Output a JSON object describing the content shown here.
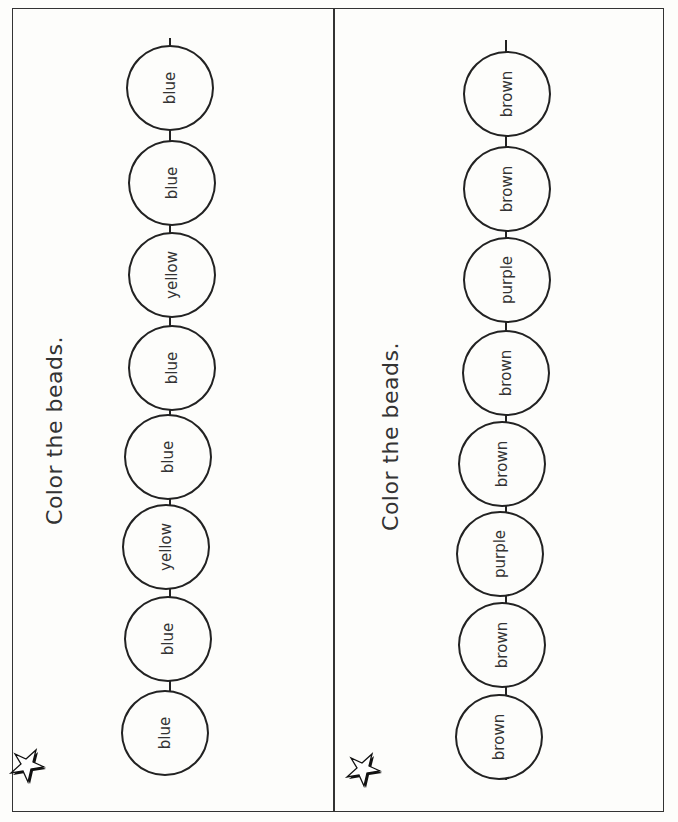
{
  "worksheet": {
    "panels": [
      {
        "instruction": "Color the beads.",
        "beads": [
          "blue",
          "blue",
          "yellow",
          "blue",
          "blue",
          "yellow",
          "blue",
          "blue"
        ]
      },
      {
        "instruction": "Color the beads.",
        "beads": [
          "brown",
          "brown",
          "purple",
          "brown",
          "brown",
          "purple",
          "brown",
          "brown"
        ]
      }
    ],
    "icon": "star-icon"
  }
}
